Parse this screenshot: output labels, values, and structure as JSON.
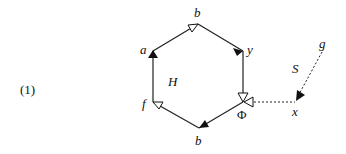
{
  "equation_number": "(1)",
  "graph": {
    "name": "H",
    "vertices": {
      "a": "a",
      "b_top": "b",
      "y": "y",
      "phi": "Φ",
      "b_bottom": "b",
      "f": "f"
    },
    "edge_labels": {
      "S": "S"
    },
    "external": {
      "x": "x",
      "g": "g"
    }
  },
  "colors": {
    "line": "#222222",
    "background": "#ffffff"
  }
}
